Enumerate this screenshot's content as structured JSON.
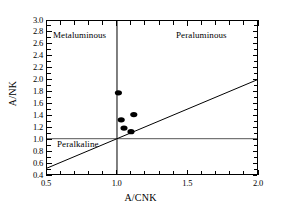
{
  "chart_data": {
    "type": "scatter",
    "title": "",
    "xlabel": "A/CNK",
    "ylabel": "A/NK",
    "xlim": [
      0.5,
      2.0
    ],
    "ylim": [
      0.4,
      3.0
    ],
    "grid": false,
    "legend": "none",
    "x_ticks": [
      "0.5",
      "1.0",
      "1.5",
      "2.0"
    ],
    "x_tick_values": [
      0.5,
      1.0,
      1.5,
      2.0
    ],
    "x_minor_tick_values": [
      0.6,
      0.7,
      0.8,
      0.9,
      1.1,
      1.2,
      1.3,
      1.4,
      1.6,
      1.7,
      1.8,
      1.9
    ],
    "y_ticks": [
      "3.0",
      "2.8",
      "2.6",
      "2.4",
      "2.2",
      "2.0",
      "1.8",
      "1.6",
      "1.4",
      "1.2",
      "1.0",
      "0.8",
      "0.6",
      "0.4"
    ],
    "y_tick_values": [
      3.0,
      2.8,
      2.6,
      2.4,
      2.2,
      2.0,
      1.8,
      1.6,
      1.4,
      1.2,
      1.0,
      0.8,
      0.6,
      0.4
    ],
    "series": [
      {
        "name": "samples",
        "marker": "filled-circle",
        "color": "#000000",
        "points": [
          {
            "x": 1.01,
            "y": 1.78
          },
          {
            "x": 1.03,
            "y": 1.32
          },
          {
            "x": 1.12,
            "y": 1.41
          },
          {
            "x": 1.05,
            "y": 1.18
          },
          {
            "x": 1.1,
            "y": 1.12
          }
        ]
      }
    ],
    "reference_lines": [
      {
        "name": "acnk-unity-vertical",
        "type": "vertical",
        "value": 1.0,
        "color": "#000000"
      },
      {
        "name": "ank-unity-horizontal",
        "type": "horizontal",
        "value": 1.0,
        "color": "#555555"
      },
      {
        "name": "identity-diagonal",
        "type": "segment",
        "x1": 0.5,
        "y1": 0.5,
        "x2": 2.0,
        "y2": 2.0,
        "color": "#000000"
      }
    ],
    "annotations": [
      {
        "name": "metaluminous",
        "text": "Metaluminous",
        "x": 0.55,
        "y": 2.82
      },
      {
        "name": "peraluminous",
        "text": "Peraluminous",
        "x": 1.42,
        "y": 2.82
      },
      {
        "name": "peralkaline",
        "text": "Peralkaline",
        "x": 0.58,
        "y": 0.93
      }
    ]
  },
  "axis": {
    "x_title": "A/CNK",
    "y_title": "A/NK"
  }
}
